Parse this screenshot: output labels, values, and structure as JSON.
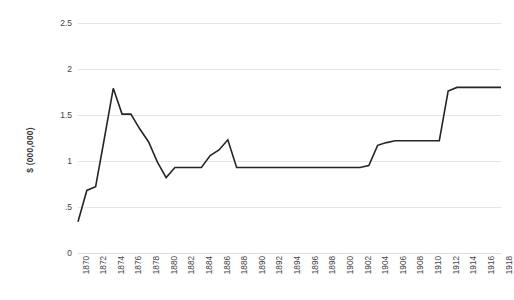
{
  "chart_data": {
    "type": "line",
    "title": "",
    "xlabel": "",
    "ylabel": "$ (000,000)",
    "ylim": [
      0,
      2.5
    ],
    "xlim": [
      1870,
      1918
    ],
    "grid": true,
    "legend": "none",
    "y_ticks": [
      "0",
      ".5",
      "1",
      "1.5",
      "2",
      "2.5"
    ],
    "y_tick_values": [
      0,
      0.5,
      1,
      1.5,
      2,
      2.5
    ],
    "x_ticks": [
      "1870",
      "1872",
      "1874",
      "1876",
      "1878",
      "1880",
      "1882",
      "1884",
      "1886",
      "1888",
      "1890",
      "1892",
      "1894",
      "1896",
      "1898",
      "1900",
      "1902",
      "1904",
      "1906",
      "1908",
      "1910",
      "1912",
      "1914",
      "1916",
      "1918"
    ],
    "series": [
      {
        "name": "value",
        "color": "#262626",
        "x": [
          1870,
          1871,
          1872,
          1873,
          1874,
          1875,
          1876,
          1877,
          1878,
          1879,
          1880,
          1881,
          1882,
          1883,
          1884,
          1885,
          1886,
          1887,
          1888,
          1889,
          1890,
          1891,
          1892,
          1893,
          1894,
          1895,
          1896,
          1897,
          1898,
          1899,
          1900,
          1901,
          1902,
          1903,
          1904,
          1905,
          1906,
          1907,
          1908,
          1909,
          1910,
          1911,
          1912,
          1913,
          1914,
          1915,
          1916,
          1917,
          1918
        ],
        "values": [
          0.34,
          0.68,
          0.72,
          1.25,
          1.79,
          1.51,
          1.51,
          1.35,
          1.21,
          0.99,
          0.82,
          0.93,
          0.93,
          0.93,
          0.93,
          1.06,
          1.12,
          1.23,
          0.93,
          0.93,
          0.93,
          0.93,
          0.93,
          0.93,
          0.93,
          0.93,
          0.93,
          0.93,
          0.93,
          0.93,
          0.93,
          0.93,
          0.93,
          0.95,
          1.17,
          1.2,
          1.22,
          1.22,
          1.22,
          1.22,
          1.22,
          1.22,
          1.76,
          1.8,
          1.8,
          1.8,
          1.8,
          1.8,
          1.8
        ]
      }
    ]
  }
}
